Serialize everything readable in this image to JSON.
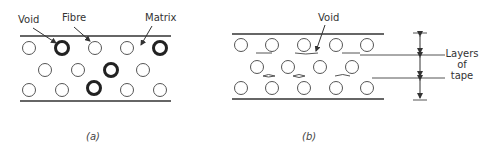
{
  "panel_a": {
    "caption": "(a)",
    "labels": {
      "void": "Void",
      "fibre": "Fibre",
      "matrix": "Matrix"
    }
  },
  "panel_b": {
    "caption": "(b)",
    "labels": {
      "void": "Void",
      "layers_line1": "Layers",
      "layers_line2": "of",
      "layers_line3": "tape"
    }
  },
  "colors": {
    "line": "#333333",
    "fibre": "#555555",
    "void": "#222222"
  }
}
